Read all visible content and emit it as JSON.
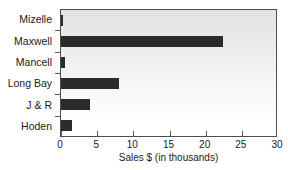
{
  "chart_data": {
    "type": "bar",
    "orientation": "horizontal",
    "title": "",
    "xlabel": "Sales $ (in thousands)",
    "ylabel": "",
    "categories": [
      "Mizelle",
      "Maxwell",
      "Mancell",
      "Long Bay",
      "J & R",
      "Hoden"
    ],
    "values": [
      0.2,
      22.4,
      0.5,
      8.0,
      4.0,
      1.5
    ],
    "xticks": [
      0,
      5,
      10,
      15,
      20,
      25,
      30
    ],
    "xlim": [
      0,
      30
    ],
    "grid": false,
    "legend": null,
    "bar_color": "#2b2b2b",
    "plot_background_top": "#e3e3e3",
    "plot_background_bottom": "#ffffff",
    "axis_color": "#4d4d4d"
  }
}
